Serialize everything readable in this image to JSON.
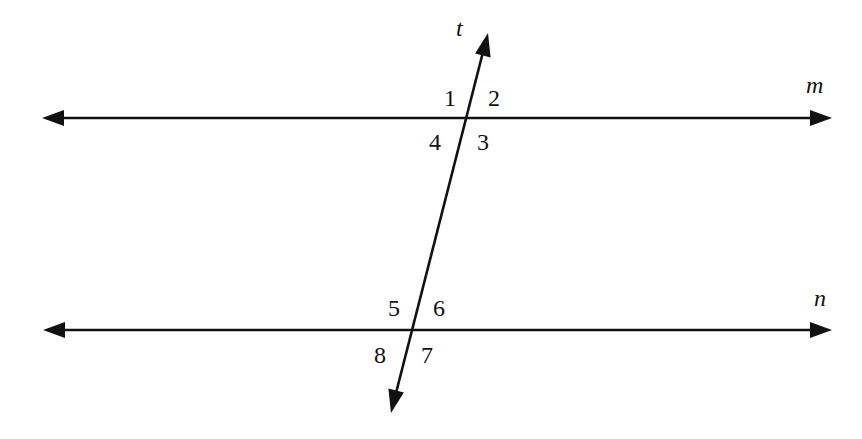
{
  "diagram": {
    "colors": {
      "stroke": "#111111",
      "background": "#ffffff"
    },
    "lines": {
      "m": {
        "label": "m",
        "from": [
          42,
          118
        ],
        "to": [
          832,
          118
        ],
        "arrows": "both"
      },
      "n": {
        "label": "n",
        "from": [
          43,
          330
        ],
        "to": [
          832,
          330
        ],
        "arrows": "both"
      },
      "t": {
        "label": "t",
        "from": [
          391,
          413
        ],
        "to": [
          488,
          33
        ],
        "arrows": "both"
      }
    },
    "intersections": {
      "t_m": [
        465,
        118
      ],
      "t_n": [
        411,
        330
      ]
    },
    "angles": [
      {
        "number": "1",
        "position": "upper-left at t∩m"
      },
      {
        "number": "2",
        "position": "upper-right at t∩m"
      },
      {
        "number": "3",
        "position": "lower-right at t∩m"
      },
      {
        "number": "4",
        "position": "lower-left at t∩m"
      },
      {
        "number": "5",
        "position": "upper-left at t∩n"
      },
      {
        "number": "6",
        "position": "upper-right at t∩n"
      },
      {
        "number": "7",
        "position": "lower-right at t∩n"
      },
      {
        "number": "8",
        "position": "lower-left at t∩n"
      }
    ]
  }
}
